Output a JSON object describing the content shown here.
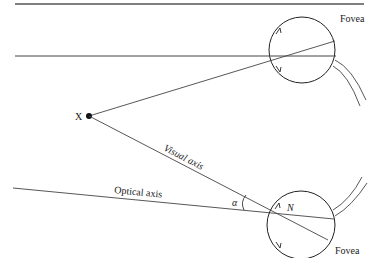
{
  "diagram": {
    "type": "optics-eye-axes",
    "labels": {
      "fixation_point": "X",
      "fovea_top": "Fovea",
      "fovea_bottom": "Fovea",
      "visual_axis": "Visual axis",
      "optical_axis": "Optical axis",
      "angle": "α",
      "nodal_point": "N"
    },
    "colors": {
      "stroke": "#333333",
      "background": "#ffffff"
    }
  }
}
